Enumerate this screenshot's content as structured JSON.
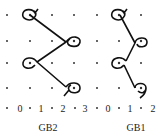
{
  "diagram": {
    "grid": {
      "columns_x": [
        7,
        30,
        52,
        74,
        97,
        119,
        141,
        163
      ],
      "rows_y": [
        15,
        41,
        63,
        88
      ]
    },
    "axis_row": {
      "y": 108,
      "items": [
        {
          "type": "dot",
          "x": 7
        },
        {
          "type": "num",
          "text": "0",
          "x": 20
        },
        {
          "type": "dot",
          "x": 30
        },
        {
          "type": "num",
          "text": "1",
          "x": 41
        },
        {
          "type": "dot",
          "x": 52
        },
        {
          "type": "num",
          "text": "2",
          "x": 63
        },
        {
          "type": "dot",
          "x": 75
        },
        {
          "type": "num",
          "text": "3",
          "x": 85
        },
        {
          "type": "dot",
          "x": 97
        },
        {
          "type": "num",
          "text": "0",
          "x": 108
        },
        {
          "type": "dot",
          "x": 119
        },
        {
          "type": "num",
          "text": "1",
          "x": 130
        },
        {
          "type": "dot",
          "x": 141
        },
        {
          "type": "num",
          "text": "2",
          "x": 153
        }
      ]
    },
    "panels": [
      {
        "name": "GB2",
        "label": "GB2",
        "label_x": 48,
        "label_y": 127,
        "loops": [
          {
            "x": 30,
            "y": 15,
            "open": "left"
          },
          {
            "x": 74,
            "y": 41,
            "open": "right"
          },
          {
            "x": 30,
            "y": 63,
            "open": "left"
          },
          {
            "x": 74,
            "y": 88,
            "open": "right"
          }
        ]
      },
      {
        "name": "GB1",
        "label": "GB1",
        "label_x": 136,
        "label_y": 127,
        "loops": [
          {
            "x": 119,
            "y": 15,
            "open": "left"
          },
          {
            "x": 141,
            "y": 41,
            "open": "right"
          },
          {
            "x": 119,
            "y": 63,
            "open": "left"
          },
          {
            "x": 141,
            "y": 88,
            "open": "right"
          }
        ]
      }
    ],
    "stroke_color": "#111111",
    "dot_color": "#333333"
  }
}
